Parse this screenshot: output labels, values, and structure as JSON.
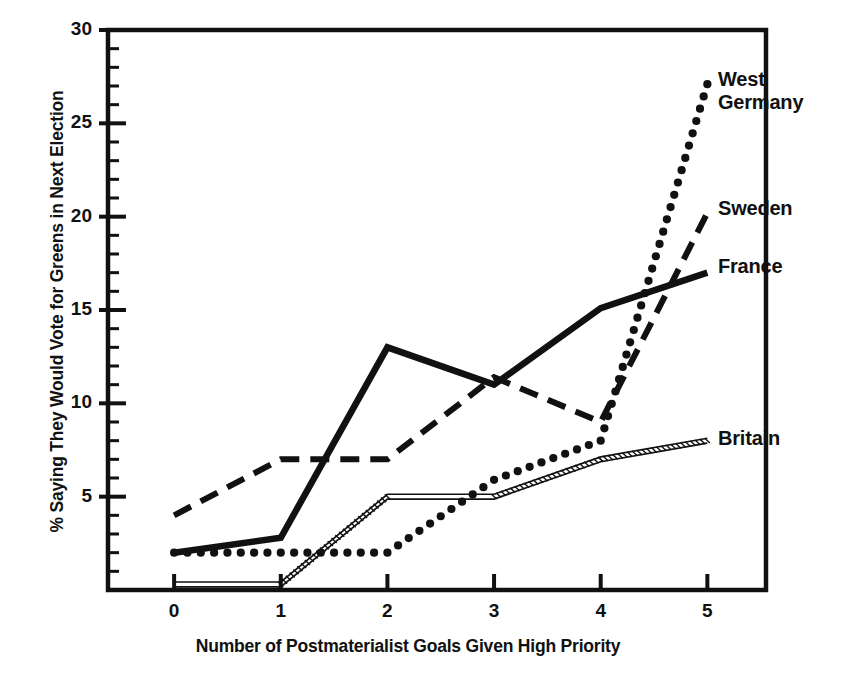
{
  "chart_data": {
    "type": "line",
    "title": "",
    "xlabel": "Number of Postmaterialist Goals Given High Priority",
    "ylabel": "% Saying They Would Vote for Greens in Next Election",
    "x": [
      0,
      1,
      2,
      3,
      4,
      5
    ],
    "xticklabels": [
      "0",
      "1",
      "2",
      "3",
      "4",
      "5"
    ],
    "yticklabels": [
      "5",
      "10",
      "15",
      "20",
      "25",
      "30"
    ],
    "ytickvalues": [
      5,
      10,
      15,
      20,
      25,
      30
    ],
    "xlim": [
      -0.62,
      5.55
    ],
    "ylim": [
      0,
      30
    ],
    "grid": false,
    "legend_position": "right-inline-labels",
    "minor_tick_interval": 1,
    "series": [
      {
        "name": "West Germany",
        "style": "dotted",
        "color": "#111111",
        "values": [
          2,
          2,
          2,
          5.9,
          8,
          27.1
        ],
        "label_x": 5.28,
        "label_y": 27.5
      },
      {
        "name": "Sweden",
        "style": "dashed",
        "color": "#111111",
        "values": [
          4,
          7,
          7,
          11.4,
          9,
          20.2
        ],
        "label_x": 5.28,
        "label_y": 20.3
      },
      {
        "name": "France",
        "style": "solid",
        "color": "#111111",
        "values": [
          2,
          2.8,
          13,
          11,
          15.1,
          17
        ],
        "label_x": 5.28,
        "label_y": 17.1
      },
      {
        "name": "Britain",
        "style": "double-thin",
        "color": "#111111",
        "values": [
          0.3,
          0.3,
          5,
          5,
          7,
          8
        ],
        "label_x": 5.28,
        "label_y": 8.1
      }
    ]
  },
  "labels": {
    "west_germany": "West\nGermany",
    "west_germany_line1": "West",
    "west_germany_line2": "Germany",
    "sweden": "Sweden",
    "france": "France",
    "britain": "Britain"
  }
}
